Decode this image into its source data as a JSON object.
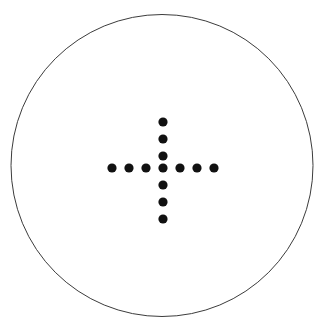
{
  "canvas": {
    "width": 326,
    "height": 330,
    "background_color": "#ffffff"
  },
  "figure": {
    "name": "dot-cross-in-circle"
  },
  "boundary_circle": {
    "center_x": 162,
    "center_y": 165.5,
    "radius": 151,
    "stroke_color": "#3c3c3c",
    "stroke_width": 1,
    "fill": "none"
  },
  "dot_style": {
    "radius": 4.6,
    "fill_color": "#111111"
  },
  "cross": {
    "center_x": 163,
    "center_y": 168,
    "spacing": 17,
    "arm_length": 3,
    "horizontal_count": 7,
    "vertical_count": 7,
    "total_dots": 13
  },
  "dots": [
    {
      "id": "dot-v-top-3",
      "x": 163,
      "y": 122
    },
    {
      "id": "dot-v-top-2",
      "x": 163,
      "y": 139
    },
    {
      "id": "dot-v-top-1",
      "x": 163,
      "y": 156
    },
    {
      "id": "dot-h-left-3",
      "x": 112,
      "y": 168
    },
    {
      "id": "dot-h-left-2",
      "x": 129,
      "y": 168
    },
    {
      "id": "dot-h-left-1",
      "x": 146,
      "y": 168
    },
    {
      "id": "dot-center",
      "x": 163,
      "y": 168
    },
    {
      "id": "dot-h-right-1",
      "x": 180,
      "y": 168
    },
    {
      "id": "dot-h-right-2",
      "x": 197,
      "y": 168
    },
    {
      "id": "dot-h-right-3",
      "x": 214,
      "y": 168
    },
    {
      "id": "dot-v-bottom-1",
      "x": 163,
      "y": 185
    },
    {
      "id": "dot-v-bottom-2",
      "x": 163,
      "y": 202
    },
    {
      "id": "dot-v-bottom-3",
      "x": 163,
      "y": 219
    }
  ]
}
